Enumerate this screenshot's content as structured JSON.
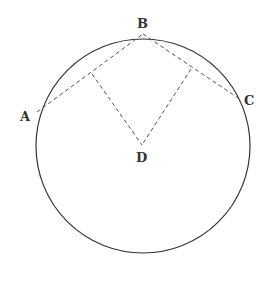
{
  "diagram": {
    "type": "geometry",
    "colors": {
      "stroke": "#333333",
      "dashed": "#555555",
      "label": "#333333",
      "background": "#ffffff"
    },
    "circle": {
      "cx": 143,
      "cy": 146,
      "r": 107
    },
    "points": {
      "A": {
        "label": "A",
        "x": 37,
        "y": 112
      },
      "B": {
        "label": "B",
        "x": 143,
        "y": 34
      },
      "C": {
        "label": "C",
        "x": 241,
        "y": 100
      },
      "D": {
        "label": "D",
        "x": 142,
        "y": 145
      },
      "M_AB": {
        "label": "",
        "x": 92,
        "y": 74
      },
      "M_BC": {
        "label": "",
        "x": 191,
        "y": 69
      }
    },
    "segments": [
      {
        "from": "A",
        "to": "B",
        "style": "dashed"
      },
      {
        "from": "B",
        "to": "C",
        "style": "dashed"
      },
      {
        "from": "M_AB",
        "to": "D",
        "style": "dashed"
      },
      {
        "from": "M_BC",
        "to": "D",
        "style": "dashed"
      }
    ],
    "labels": {
      "A": "A",
      "B": "B",
      "C": "C",
      "D": "D"
    }
  }
}
